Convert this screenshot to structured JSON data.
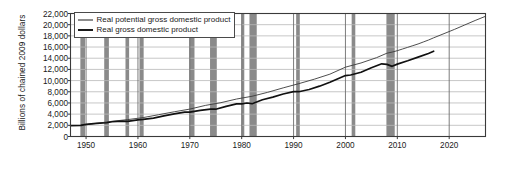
{
  "chart_data": {
    "type": "line",
    "title": "",
    "xlabel": "",
    "ylabel": "Billions of chained 2009 dollars",
    "xlim": [
      1947,
      2027
    ],
    "ylim": [
      0,
      22000
    ],
    "grid": true,
    "legend_position": "top-left-inside",
    "ytick_labels": [
      "0",
      "2,000",
      "4,000",
      "6,000",
      "8,000",
      "10,000",
      "12,000",
      "14,000",
      "16,000",
      "18,000",
      "20,000",
      "22,000"
    ],
    "ytick_values": [
      0,
      2000,
      4000,
      6000,
      8000,
      10000,
      12000,
      14000,
      16000,
      18000,
      20000,
      22000
    ],
    "xtick_labels": [
      "1950",
      "1960",
      "1970",
      "1980",
      "1990",
      "2000",
      "2010",
      "2020"
    ],
    "xtick_values": [
      1950,
      1960,
      1970,
      1980,
      1990,
      2000,
      2010,
      2020
    ],
    "series": [
      {
        "name": "Real potential gross domestic product",
        "style": "thin",
        "color": "#3a3a3a",
        "width": 0.9,
        "x": [
          1949,
          1952,
          1955,
          1958,
          1961,
          1964,
          1967,
          1970,
          1973,
          1976,
          1979,
          1982,
          1985,
          1988,
          1991,
          1994,
          1997,
          2000,
          2003,
          2006,
          2008,
          2009,
          2010,
          2011,
          2012,
          2013,
          2014,
          2015,
          2016,
          2017,
          2019,
          2021,
          2023,
          2025,
          2027
        ],
        "y": [
          2020,
          2350,
          2720,
          3020,
          3380,
          3900,
          4420,
          4900,
          5560,
          6050,
          6700,
          7200,
          7900,
          8700,
          9450,
          10250,
          11150,
          12400,
          13150,
          14100,
          14900,
          15100,
          15350,
          15650,
          15950,
          16250,
          16550,
          16900,
          17250,
          17650,
          18400,
          19150,
          19950,
          20750,
          21500
        ]
      },
      {
        "name": "Real gross domestic product",
        "style": "thick",
        "color": "#111111",
        "width": 1.7,
        "x": [
          1947,
          1949,
          1950,
          1952,
          1954,
          1955,
          1957,
          1958,
          1960,
          1961,
          1963,
          1965,
          1967,
          1969,
          1970,
          1972,
          1974,
          1975,
          1977,
          1979,
          1980,
          1981,
          1982,
          1984,
          1986,
          1988,
          1990,
          1991,
          1993,
          1995,
          1997,
          1999,
          2000,
          2001,
          2003,
          2005,
          2007,
          2008,
          2009,
          2010,
          2012,
          2014,
          2016,
          2017
        ],
        "y": [
          1930,
          1990,
          2180,
          2360,
          2460,
          2640,
          2760,
          2720,
          2980,
          3050,
          3300,
          3700,
          4050,
          4350,
          4350,
          4660,
          4890,
          4880,
          5400,
          5840,
          5830,
          5990,
          5870,
          6580,
          7050,
          7600,
          8030,
          8010,
          8400,
          9000,
          9700,
          10500,
          10900,
          11000,
          11500,
          12300,
          13000,
          12900,
          12550,
          12950,
          13550,
          14200,
          14850,
          15250
        ]
      }
    ],
    "recession_bands": [
      {
        "start": 1948.9,
        "end": 1949.8
      },
      {
        "start": 1953.5,
        "end": 1954.4
      },
      {
        "start": 1957.6,
        "end": 1958.3
      },
      {
        "start": 1960.3,
        "end": 1961.1
      },
      {
        "start": 1969.9,
        "end": 1970.9
      },
      {
        "start": 1973.9,
        "end": 1975.2
      },
      {
        "start": 1980.0,
        "end": 1980.5
      },
      {
        "start": 1981.5,
        "end": 1982.9
      },
      {
        "start": 1990.5,
        "end": 1991.2
      },
      {
        "start": 2001.2,
        "end": 2001.9
      },
      {
        "start": 2007.9,
        "end": 2009.5
      }
    ],
    "recession_band_color": "#8a8a8a",
    "grid_color": "#b9b9b9",
    "axis_color": "#3a3a3a",
    "background_color": "#ffffff"
  },
  "legend": {
    "items": [
      {
        "label": "Real potential gross domestic product"
      },
      {
        "label": "Real gross domestic product"
      }
    ]
  }
}
